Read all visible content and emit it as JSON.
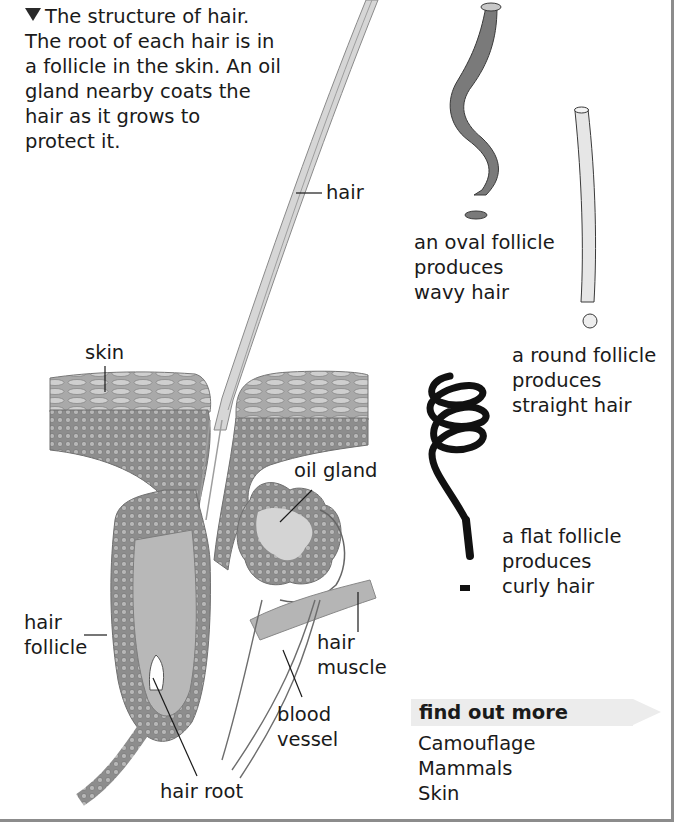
{
  "caption": {
    "marker": "triangle-down",
    "text_lines": [
      "The structure of hair.",
      "The root of each hair is in",
      "a follicle in the skin. An oil",
      "gland nearby coats the",
      "hair as it grows to",
      "protect it."
    ]
  },
  "diagram_labels": {
    "hair": "hair",
    "skin": "skin",
    "oil_gland": "oil gland",
    "hair_follicle": [
      "hair",
      "follicle"
    ],
    "hair_muscle": [
      "hair",
      "muscle"
    ],
    "blood_vessel": [
      "blood",
      "vessel"
    ],
    "hair_root": "hair root"
  },
  "hair_types": [
    {
      "name": "wavy",
      "lines": [
        "an oval follicle",
        "produces",
        "wavy hair"
      ],
      "fill": "#7a7a7a"
    },
    {
      "name": "straight",
      "lines": [
        "a round follicle",
        "produces",
        "straight hair"
      ],
      "fill": "#e6e6e6"
    },
    {
      "name": "curly",
      "lines": [
        "a flat follicle",
        "produces",
        "curly hair"
      ],
      "fill": "#111111"
    }
  ],
  "find_out_more": {
    "title": "find out more",
    "items": [
      "Camouflage",
      "Mammals",
      "Skin"
    ]
  },
  "colors": {
    "frame": "#8c8c8c",
    "tissue": "#8d8d8d",
    "tissue_light": "#c9c9c9",
    "banner": "#ececec"
  }
}
